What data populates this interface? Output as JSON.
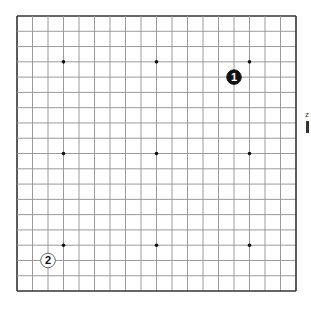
{
  "board": {
    "size": 19,
    "origin_x": 17,
    "origin_y": 16,
    "step_x": 15.5,
    "step_y": 15.28,
    "grid_color": "#9a9a9a",
    "border_color": "#333333",
    "star_points": [
      [
        3,
        3
      ],
      [
        9,
        3
      ],
      [
        15,
        3
      ],
      [
        3,
        9
      ],
      [
        9,
        9
      ],
      [
        15,
        9
      ],
      [
        3,
        15
      ],
      [
        9,
        15
      ],
      [
        15,
        15
      ]
    ]
  },
  "stones": [
    {
      "color": "black",
      "col": 14,
      "row": 4,
      "label": "1"
    },
    {
      "color": "white",
      "col": 2,
      "row": 16,
      "label": "2"
    }
  ],
  "edge_fragments": [
    {
      "text": "z"
    }
  ]
}
